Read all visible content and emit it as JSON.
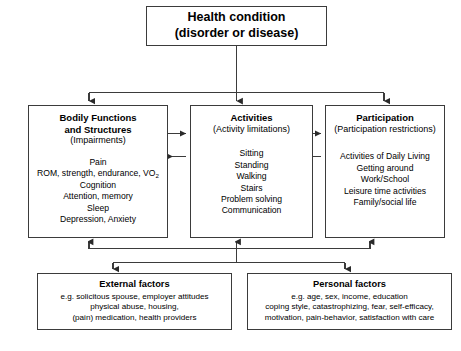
{
  "diagram": {
    "line_color": "#3b3b3b",
    "background": "#ffffff",
    "text_color": "#000000"
  },
  "health_condition": {
    "title": "Health condition\n(disorder or disease)"
  },
  "bodily_functions": {
    "title": "Bodily Functions\nand Structures",
    "subtitle": "(Impairments)",
    "items_before_vo2": "Pain\nROM, strength, endurance, VO",
    "vo2_subscript": "2",
    "items_after_vo2": "Cognition\nAttention, memory\nSleep\nDepression, Anxiety"
  },
  "activities": {
    "title": "Activities",
    "subtitle": "(Activity limitations)",
    "items": "Sitting\nStanding\nWalking\nStairs\nProblem solving\nCommunication"
  },
  "participation": {
    "title": "Participation",
    "subtitle": "(Participation restrictions)",
    "items": "Activities of Daily Living\nGetting around\nWork/School\nLeisure time activities\nFamily/social life"
  },
  "external_factors": {
    "title": "External factors",
    "items": "e.g. solicitous spouse, employer attitudes\nphysical abuse, housing,\n(pain) medication, health providers"
  },
  "personal_factors": {
    "title": "Personal factors",
    "items": "e.g. age, sex, income, education\ncoping style, catastrophizing, fear, self-efficacy,\nmotivation, pain-behavior, satisfaction with care"
  }
}
